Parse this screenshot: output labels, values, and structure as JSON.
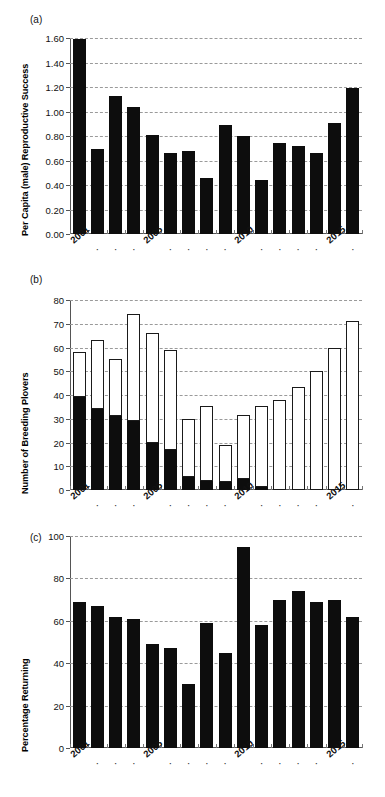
{
  "figure": {
    "panels": [
      {
        "tag": "(a)"
      },
      {
        "tag": "(b)"
      },
      {
        "tag": "(c)"
      }
    ]
  },
  "chart_data": [
    {
      "type": "bar",
      "panel": "(a)",
      "title": "",
      "xlabel": "",
      "ylabel": "Per Capita (male) Reproductive Success",
      "ylim": [
        0,
        1.6
      ],
      "yticks": [
        "0.00",
        "0.20",
        "0.40",
        "0.60",
        "0.80",
        "1.00",
        "1.20",
        "1.40",
        "1.60"
      ],
      "ytick_values": [
        0,
        0.2,
        0.4,
        0.6,
        0.8,
        1.0,
        1.2,
        1.4,
        1.6
      ],
      "grid": true,
      "legend": "none",
      "bar_color": "#0d0d0d",
      "categories": [
        "2001",
        "2002",
        "2003",
        "2004",
        "2005",
        "2006",
        "2007",
        "2008",
        "2009",
        "2010",
        "2011",
        "2012",
        "2013",
        "2014",
        "2015",
        "2016"
      ],
      "xtick_labels": [
        "2001",
        "·",
        "·",
        "·",
        "2005",
        "·",
        "·",
        "·",
        "·",
        "2010",
        "·",
        "·",
        "·",
        "·",
        "2015",
        "·"
      ],
      "values": [
        1.59,
        0.69,
        1.13,
        1.04,
        0.81,
        0.66,
        0.68,
        0.46,
        0.89,
        0.8,
        0.44,
        0.74,
        0.72,
        0.66,
        0.91,
        1.19
      ]
    },
    {
      "type": "bar",
      "panel": "(b)",
      "stacked": true,
      "title": "",
      "xlabel": "",
      "ylabel": "Number of Breeding Plovers",
      "ylim": [
        0,
        80
      ],
      "yticks": [
        "0",
        "10",
        "20",
        "30",
        "40",
        "50",
        "60",
        "70",
        "80"
      ],
      "ytick_values": [
        0,
        10,
        20,
        30,
        40,
        50,
        60,
        70,
        80
      ],
      "grid": true,
      "legend": "none",
      "categories": [
        "2001",
        "2002",
        "2003",
        "2004",
        "2005",
        "2006",
        "2007",
        "2008",
        "2009",
        "2010",
        "2011",
        "2012",
        "2013",
        "2014",
        "2015",
        "2016"
      ],
      "xtick_labels": [
        "2001",
        "·",
        "·",
        "·",
        "2005",
        "·",
        "·",
        "·",
        "·",
        "2010",
        "·",
        "·",
        "·",
        "·",
        "2015",
        "·"
      ],
      "series": [
        {
          "name": "black-segment",
          "color": "#0d0d0d",
          "values": [
            39,
            34,
            31,
            29,
            20,
            17,
            5.5,
            4,
            3.5,
            4.5,
            1.2,
            0,
            0,
            0,
            0,
            0
          ]
        },
        {
          "name": "white-segment",
          "color": "#ffffff",
          "values": [
            19,
            29,
            24,
            45,
            46,
            42,
            24.5,
            31.5,
            15.5,
            27,
            34,
            38,
            43.5,
            50,
            60,
            71
          ]
        }
      ],
      "totals": [
        58,
        63,
        55,
        74,
        66,
        59,
        30,
        35.5,
        19,
        31.5,
        35.2,
        38,
        43.5,
        50,
        60,
        71
      ]
    },
    {
      "type": "bar",
      "panel": "(c)",
      "title": "",
      "xlabel": "",
      "ylabel": "Percentage Returning",
      "ylim": [
        0,
        100
      ],
      "yticks": [
        "0",
        "20",
        "40",
        "60",
        "80",
        "100"
      ],
      "ytick_values": [
        0,
        20,
        40,
        60,
        80,
        100
      ],
      "grid": true,
      "legend": "none",
      "bar_color": "#0d0d0d",
      "categories": [
        "2001",
        "2002",
        "2003",
        "2004",
        "2005",
        "2006",
        "2007",
        "2008",
        "2009",
        "2010",
        "2011",
        "2012",
        "2013",
        "2014",
        "2015",
        "2016"
      ],
      "xtick_labels": [
        "2001",
        "·",
        "·",
        "·",
        "2005",
        "·",
        "·",
        "·",
        "·",
        "2010",
        "·",
        "·",
        "·",
        "·",
        "2015",
        "·"
      ],
      "values": [
        69,
        67,
        62,
        61,
        49,
        47,
        30,
        59,
        45,
        95,
        58,
        70,
        74,
        69,
        70,
        62
      ]
    }
  ]
}
